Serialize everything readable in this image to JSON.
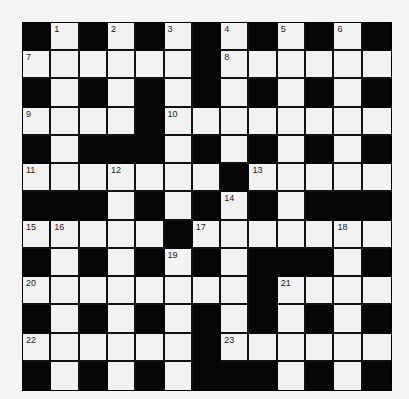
{
  "puzzle": {
    "rows": 13,
    "cols": 13,
    "colors": {
      "black_cell": "#060606",
      "white_cell": "#f2f2f2",
      "background": "#f4f4f4",
      "number_text": "#222222"
    },
    "layout": [
      "#.#.#.#.#.#.#",
      "......#......",
      "#.#.#.#.#.#.#",
      "....#........",
      "#.###.#.#.#.#",
      ".......#.....",
      "###.#.#.#.###",
      ".....#.......",
      "#.#.#.#.###.#",
      "........#....",
      "#.#.#.#.#.#.#",
      "......#......",
      "#.#.#.###.#.#"
    ],
    "numbers": [
      {
        "row": 0,
        "col": 1,
        "label": "1"
      },
      {
        "row": 0,
        "col": 3,
        "label": "2"
      },
      {
        "row": 0,
        "col": 5,
        "label": "3"
      },
      {
        "row": 0,
        "col": 7,
        "label": "4"
      },
      {
        "row": 0,
        "col": 9,
        "label": "5"
      },
      {
        "row": 0,
        "col": 11,
        "label": "6"
      },
      {
        "row": 1,
        "col": 0,
        "label": "7"
      },
      {
        "row": 1,
        "col": 7,
        "label": "8"
      },
      {
        "row": 3,
        "col": 0,
        "label": "9"
      },
      {
        "row": 3,
        "col": 5,
        "label": "10"
      },
      {
        "row": 5,
        "col": 0,
        "label": "11"
      },
      {
        "row": 5,
        "col": 3,
        "label": "12"
      },
      {
        "row": 5,
        "col": 8,
        "label": "13"
      },
      {
        "row": 6,
        "col": 7,
        "label": "14"
      },
      {
        "row": 7,
        "col": 0,
        "label": "15"
      },
      {
        "row": 7,
        "col": 1,
        "label": "16"
      },
      {
        "row": 7,
        "col": 6,
        "label": "17"
      },
      {
        "row": 7,
        "col": 11,
        "label": "18"
      },
      {
        "row": 8,
        "col": 5,
        "label": "19"
      },
      {
        "row": 9,
        "col": 0,
        "label": "20"
      },
      {
        "row": 9,
        "col": 9,
        "label": "21"
      },
      {
        "row": 11,
        "col": 0,
        "label": "22"
      },
      {
        "row": 11,
        "col": 7,
        "label": "23"
      }
    ]
  }
}
